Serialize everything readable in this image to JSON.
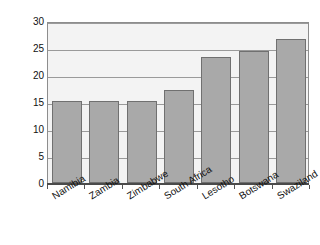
{
  "chart_data": {
    "type": "bar",
    "title": "",
    "xlabel": "",
    "ylabel": "Percentage",
    "categories": [
      "Namibia",
      "Zambia",
      "Zimbabwe",
      "South Africa",
      "Lesotho",
      "Botswana",
      "Swaziland"
    ],
    "values": [
      15.1,
      15.2,
      15.2,
      17.3,
      23.3,
      24.4,
      26.6
    ],
    "ylim": [
      0,
      30
    ],
    "ytick_labels": [
      "0",
      "5",
      "10",
      "15",
      "20",
      "25",
      "30"
    ],
    "ytick_values": [
      0,
      5,
      10,
      15,
      20,
      25,
      30
    ],
    "grid": true,
    "legend": "none",
    "bar_color": "#a9a9a9",
    "bar_border_color": "#707070",
    "plot_background": "#f3f3f3",
    "axis_color": "#4a4a4a",
    "gridline_color": "#9a9a9a"
  }
}
